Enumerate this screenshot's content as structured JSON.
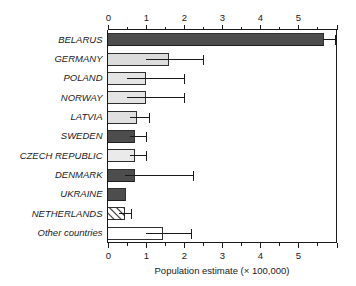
{
  "chart_data": {
    "type": "bar",
    "orientation": "horizontal",
    "title": "",
    "xlabel": "Population estimate (× 100,000)",
    "ylabel": "",
    "xlim": [
      0,
      6.0
    ],
    "xticks": [
      0,
      1,
      2,
      3,
      4,
      5
    ],
    "xtick_labels": [
      "0",
      "1",
      "2",
      "3",
      "4",
      "5"
    ],
    "minor_tick_step": 0.5,
    "grid": false,
    "legend": "none",
    "top_axis": true,
    "bottom_axis": true,
    "categories": [
      "BELARUS",
      "GERMANY",
      "POLAND",
      "NORWAY",
      "LATVIA",
      "SWEDEN",
      "CZECH REPUBLIC",
      "DENMARK",
      "UKRAINE",
      "NETHERLANDS",
      "Other countries"
    ],
    "values": [
      5.65,
      1.6,
      1.0,
      1.0,
      0.75,
      0.7,
      0.7,
      0.7,
      0.47,
      0.45,
      1.45
    ],
    "error_high": [
      5.95,
      2.5,
      2.0,
      2.0,
      1.1,
      1.0,
      1.0,
      2.25,
      null,
      0.62,
      2.2
    ],
    "error_low": [
      5.65,
      1.0,
      0.5,
      0.5,
      0.6,
      0.6,
      0.6,
      0.45,
      null,
      0.3,
      1.0
    ],
    "bar_fills": [
      "#4d4d4d",
      "#dcdcdc",
      "#e4e4e4",
      "#e4e4e4",
      "#e0e0e0",
      "#4d4d4d",
      "#eaeaea",
      "#4d4d4d",
      "#4d4d4d",
      "hatch",
      "#ffffff"
    ],
    "bar_edge_color": "#1a1a1a",
    "hatch_pattern": "diagonal-up",
    "series": [
      {
        "name": "Population estimate",
        "values": [
          5.65,
          1.6,
          1.0,
          1.0,
          0.75,
          0.7,
          0.7,
          0.7,
          0.47,
          0.45,
          1.45
        ]
      }
    ]
  },
  "axis": {
    "x_title": "Population estimate (× 100,000)"
  }
}
